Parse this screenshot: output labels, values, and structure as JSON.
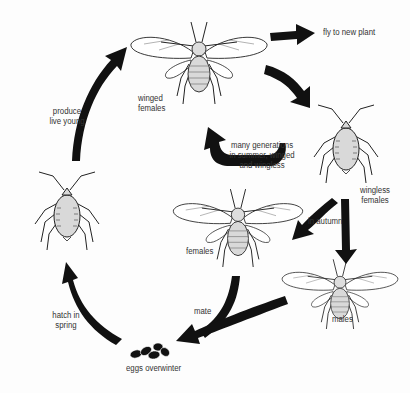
{
  "diagram": {
    "colors": {
      "arrow": "#111111",
      "body_fill": "#d9d9d9",
      "outline": "#222222",
      "wing_fill": "#ffffff",
      "text": "#333333",
      "background": "#fdfdfd"
    },
    "stages": [
      {
        "id": "winged-females",
        "label_lines": [
          "winged",
          "females"
        ]
      },
      {
        "id": "wingless-females",
        "label_lines": [
          "wingless",
          "females"
        ]
      },
      {
        "id": "females",
        "label_lines": [
          "females"
        ]
      },
      {
        "id": "males",
        "label_lines": [
          "males"
        ]
      },
      {
        "id": "eggs",
        "label_lines": [
          "eggs overwinter"
        ]
      },
      {
        "id": "nymph",
        "label_lines": []
      }
    ],
    "transitions": [
      {
        "id": "fly",
        "label_lines": [
          "fly to new plant"
        ]
      },
      {
        "id": "summer",
        "label_lines": [
          "many generations",
          "in summer, winged",
          "and  wingless"
        ]
      },
      {
        "id": "autumn",
        "label_lines": [
          "in autumn"
        ]
      },
      {
        "id": "mate",
        "label_lines": [
          "mate"
        ]
      },
      {
        "id": "hatch",
        "label_lines": [
          "hatch in",
          "spring"
        ]
      },
      {
        "id": "produce",
        "label_lines": [
          "produce",
          "live young"
        ]
      }
    ]
  }
}
